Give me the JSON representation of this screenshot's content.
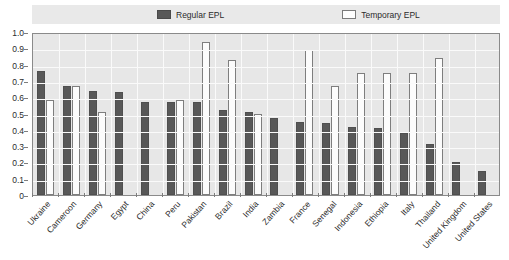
{
  "chart_data": {
    "type": "bar",
    "title": "",
    "xlabel": "",
    "ylabel": "",
    "ylim": [
      0,
      1.0
    ],
    "ytick_labels": [
      "1.0",
      "0.9",
      "0.8",
      "0.7",
      "0.6",
      "0.5",
      "0.4",
      "0.3",
      "0.2",
      "0.1",
      "0"
    ],
    "ytick_values": [
      1.0,
      0.9,
      0.8,
      0.7,
      0.6,
      0.5,
      0.4,
      0.3,
      0.2,
      0.1,
      0
    ],
    "grid": true,
    "legend_position": "top-center",
    "categories": [
      "Ukraine",
      "Cameroon",
      "Germany",
      "Egypt",
      "China",
      "Peru",
      "Pakistan",
      "Brazil",
      "India",
      "Zambia",
      "France",
      "Senegal",
      "Indonesia",
      "Ethiopia",
      "Italy",
      "Thailand",
      "United Kingdom",
      "United States"
    ],
    "series": [
      {
        "name": "Regular EPL",
        "color": "#585858",
        "values": [
          0.76,
          0.67,
          0.64,
          0.63,
          0.57,
          0.57,
          0.57,
          0.52,
          0.51,
          0.47,
          0.45,
          0.44,
          0.42,
          0.41,
          0.38,
          0.31,
          0.2,
          0.15
        ]
      },
      {
        "name": "Temporary EPL",
        "color": "#fcfcfc",
        "values": [
          0.58,
          0.67,
          0.51,
          null,
          null,
          0.58,
          0.94,
          0.83,
          0.5,
          null,
          0.89,
          0.67,
          0.75,
          0.75,
          0.75,
          0.84,
          null,
          null
        ]
      }
    ]
  },
  "legend": {
    "items": [
      {
        "label": "Regular EPL",
        "style": "dark"
      },
      {
        "label": "Temporary EPL",
        "style": "light"
      }
    ]
  },
  "colors": {
    "regular_bar": "#585858",
    "temporary_bar": "#fcfcfc",
    "plot_background": "#e7e7e7",
    "gridline": "#fafafa",
    "axis": "#8a8a8a",
    "legend_band": "#e9e9e9",
    "text": "#2b2b2b"
  },
  "title_remnant": ""
}
